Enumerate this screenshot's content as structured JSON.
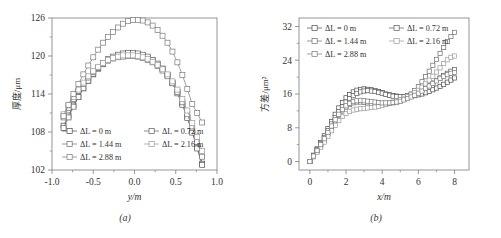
{
  "figure": {
    "background_color": "#ffffff",
    "axis_color": "#8a8a8a",
    "text_color": "#333333",
    "panels": [
      {
        "caption": "(a)",
        "name": "panel-a"
      },
      {
        "caption": "(b)",
        "name": "panel-b"
      }
    ]
  },
  "chart_data": [
    {
      "type": "line",
      "panel": "(a)",
      "title": "",
      "xlabel": "y/m",
      "ylabel": "厚度/μm",
      "xlim": [
        -1.0,
        1.0
      ],
      "ylim": [
        102,
        126
      ],
      "xticks": [
        -1.0,
        -0.5,
        0.0,
        0.5,
        1.0
      ],
      "xticklabels": [
        "-1.0",
        "-0.5",
        "0.0",
        "0.5",
        "1.0"
      ],
      "yticks": [
        102,
        108,
        114,
        120,
        126
      ],
      "yticklabels": [
        "102",
        "108",
        "114",
        "120",
        "126"
      ],
      "grid": false,
      "legend_position": "lower-center",
      "marker": "open-square",
      "series": [
        {
          "name": "ΔL = 0 m",
          "color": "#4a4a4a",
          "x": [
            -0.86,
            -0.8,
            -0.74,
            -0.68,
            -0.62,
            -0.56,
            -0.5,
            -0.44,
            -0.38,
            -0.32,
            -0.26,
            -0.2,
            -0.14,
            -0.08,
            -0.02,
            0.04,
            0.1,
            0.16,
            0.22,
            0.28,
            0.34,
            0.4,
            0.46,
            0.52,
            0.58,
            0.64,
            0.7,
            0.76,
            0.82
          ],
          "y": [
            109.0,
            110.6,
            112.2,
            113.6,
            114.9,
            116.1,
            117.1,
            118.0,
            118.7,
            119.3,
            119.7,
            120.0,
            120.2,
            120.3,
            120.3,
            120.2,
            120.0,
            119.7,
            119.3,
            118.7,
            118.0,
            117.0,
            115.8,
            114.3,
            112.5,
            110.4,
            108.1,
            105.6,
            103.0
          ]
        },
        {
          "name": "ΔL = 0.72 m",
          "color": "#5c5c5c",
          "x": [
            -0.86,
            -0.8,
            -0.74,
            -0.68,
            -0.62,
            -0.56,
            -0.5,
            -0.44,
            -0.38,
            -0.32,
            -0.26,
            -0.2,
            -0.14,
            -0.08,
            -0.02,
            0.04,
            0.1,
            0.16,
            0.22,
            0.28,
            0.34,
            0.4,
            0.46,
            0.52,
            0.58,
            0.64,
            0.7,
            0.76,
            0.82
          ],
          "y": [
            108.6,
            110.3,
            112.0,
            113.5,
            114.9,
            116.1,
            117.2,
            118.1,
            118.9,
            119.5,
            119.9,
            120.2,
            120.4,
            120.5,
            120.5,
            120.4,
            120.2,
            119.9,
            119.4,
            118.8,
            118.0,
            117.0,
            115.7,
            114.1,
            112.3,
            110.2,
            107.9,
            105.4,
            102.8
          ]
        },
        {
          "name": "ΔL = 1.44 m",
          "color": "#6e6e6e",
          "x": [
            -0.86,
            -0.8,
            -0.74,
            -0.68,
            -0.62,
            -0.56,
            -0.5,
            -0.44,
            -0.38,
            -0.32,
            -0.26,
            -0.2,
            -0.14,
            -0.08,
            -0.02,
            0.04,
            0.1,
            0.16,
            0.22,
            0.28,
            0.34,
            0.4,
            0.46,
            0.52,
            0.58,
            0.64,
            0.7,
            0.76,
            0.82
          ],
          "y": [
            110.3,
            111.8,
            113.2,
            114.5,
            115.6,
            116.6,
            117.5,
            118.2,
            118.8,
            119.3,
            119.6,
            119.8,
            119.9,
            120.0,
            120.0,
            119.9,
            119.7,
            119.4,
            119.0,
            118.4,
            117.7,
            116.8,
            115.7,
            114.3,
            112.7,
            110.8,
            108.7,
            106.4,
            104.1
          ]
        },
        {
          "name": "ΔL = 2.16 m",
          "color": "#9a9a9a",
          "x": [
            -0.86,
            -0.8,
            -0.74,
            -0.68,
            -0.62,
            -0.56,
            -0.5,
            -0.44,
            -0.38,
            -0.32,
            -0.26,
            -0.2,
            -0.14,
            -0.08,
            -0.02,
            0.04,
            0.1,
            0.16,
            0.22,
            0.28,
            0.34,
            0.4,
            0.46,
            0.52,
            0.58,
            0.64,
            0.7,
            0.76,
            0.82
          ],
          "y": [
            110.8,
            112.2,
            113.5,
            114.7,
            115.8,
            116.8,
            117.6,
            118.3,
            118.9,
            119.4,
            119.7,
            119.9,
            120.1,
            120.1,
            120.1,
            120.0,
            119.8,
            119.5,
            119.1,
            118.6,
            117.9,
            117.1,
            116.0,
            114.7,
            113.2,
            111.4,
            109.4,
            107.2,
            105.0
          ]
        },
        {
          "name": "ΔL = 2.88 m",
          "color": "#7a7a7a",
          "x": [
            -0.86,
            -0.8,
            -0.74,
            -0.68,
            -0.62,
            -0.56,
            -0.5,
            -0.44,
            -0.38,
            -0.32,
            -0.26,
            -0.2,
            -0.14,
            -0.08,
            -0.02,
            0.04,
            0.1,
            0.16,
            0.22,
            0.28,
            0.34,
            0.4,
            0.46,
            0.52,
            0.58,
            0.64,
            0.7,
            0.76,
            0.82
          ],
          "y": [
            110.5,
            112.3,
            114.0,
            115.6,
            117.1,
            118.5,
            119.8,
            121.0,
            122.1,
            123.0,
            123.8,
            124.5,
            125.1,
            125.5,
            125.7,
            125.7,
            125.6,
            125.3,
            124.8,
            124.1,
            123.2,
            122.1,
            120.7,
            119.0,
            117.0,
            114.8,
            112.4,
            111.0,
            109.5
          ]
        }
      ]
    },
    {
      "type": "line",
      "panel": "(b)",
      "title": "",
      "xlabel": "x/m",
      "ylabel": "方差/μm²",
      "xlim": [
        -0.6,
        8.8
      ],
      "ylim": [
        -2,
        34
      ],
      "xticks": [
        0,
        2,
        4,
        6,
        8
      ],
      "xticklabels": [
        "0",
        "2",
        "4",
        "6",
        "8"
      ],
      "yticks": [
        0,
        8,
        16,
        24,
        32
      ],
      "yticklabels": [
        "0",
        "8",
        "16",
        "24",
        "32"
      ],
      "grid": false,
      "legend_position": "upper-left",
      "marker": "open-square",
      "series": [
        {
          "name": "ΔL = 0 m",
          "color": "#4a4a4a",
          "x": [
            0.0,
            0.2,
            0.4,
            0.6,
            0.8,
            1.0,
            1.2,
            1.4,
            1.6,
            1.8,
            2.0,
            2.2,
            2.4,
            2.6,
            2.8,
            3.0,
            3.2,
            3.4,
            3.6,
            3.8,
            4.0,
            4.2,
            4.4,
            4.6,
            4.8,
            5.0,
            5.2,
            5.4,
            5.6,
            5.8,
            6.0,
            6.2,
            6.4,
            6.6,
            6.8,
            7.0,
            7.2,
            7.4,
            7.6,
            7.8,
            8.0
          ],
          "y": [
            0.0,
            1.5,
            3.0,
            4.5,
            6.1,
            7.8,
            9.5,
            11.2,
            12.7,
            14.0,
            15.1,
            15.9,
            16.5,
            16.9,
            17.1,
            17.2,
            17.1,
            17.0,
            16.8,
            16.6,
            16.3,
            16.0,
            15.8,
            15.6,
            15.5,
            15.4,
            15.4,
            15.4,
            15.5,
            15.6,
            15.8,
            16.0,
            16.3,
            16.6,
            17.0,
            17.4,
            17.8,
            18.3,
            18.8,
            19.3,
            19.8
          ]
        },
        {
          "name": "ΔL = 0.72 m",
          "color": "#5c5c5c",
          "x": [
            0.0,
            0.2,
            0.4,
            0.6,
            0.8,
            1.0,
            1.2,
            1.4,
            1.6,
            1.8,
            2.0,
            2.2,
            2.4,
            2.6,
            2.8,
            3.0,
            3.2,
            3.4,
            3.6,
            3.8,
            4.0,
            4.2,
            4.4,
            4.6,
            4.8,
            5.0,
            5.2,
            5.4,
            5.6,
            5.8,
            6.0,
            6.2,
            6.4,
            6.6,
            6.8,
            7.0,
            7.2,
            7.4,
            7.6,
            7.8,
            8.0
          ],
          "y": [
            0.0,
            1.4,
            2.8,
            4.2,
            5.7,
            7.3,
            8.9,
            10.4,
            11.8,
            13.0,
            14.1,
            14.9,
            15.6,
            16.1,
            16.5,
            16.7,
            16.8,
            16.7,
            16.6,
            16.4,
            16.2,
            15.9,
            15.7,
            15.5,
            15.4,
            15.4,
            15.4,
            15.6,
            15.8,
            16.1,
            16.5,
            17.0,
            17.5,
            18.0,
            18.6,
            19.2,
            19.8,
            20.4,
            20.9,
            21.4,
            21.8
          ]
        },
        {
          "name": "ΔL = 1.44 m",
          "color": "#6e6e6e",
          "x": [
            0.0,
            0.2,
            0.4,
            0.6,
            0.8,
            1.0,
            1.2,
            1.4,
            1.6,
            1.8,
            2.0,
            2.2,
            2.4,
            2.6,
            2.8,
            3.0,
            3.2,
            3.4,
            3.6,
            3.8,
            4.0,
            4.2,
            4.4,
            4.6,
            4.8,
            5.0,
            5.2,
            5.4,
            5.6,
            5.8,
            6.0,
            6.2,
            6.4,
            6.6,
            6.8,
            7.0,
            7.2,
            7.4,
            7.6,
            7.8,
            8.0
          ],
          "y": [
            0.0,
            1.2,
            2.4,
            3.7,
            5.1,
            6.6,
            8.1,
            9.6,
            10.9,
            12.0,
            12.9,
            13.5,
            13.9,
            14.1,
            14.1,
            14.0,
            13.9,
            13.8,
            13.7,
            13.7,
            13.7,
            13.7,
            13.8,
            13.9,
            14.1,
            14.4,
            14.8,
            15.3,
            16.0,
            16.8,
            17.8,
            18.9,
            20.1,
            21.4,
            22.8,
            24.2,
            25.6,
            27.0,
            28.4,
            29.6,
            30.6
          ]
        },
        {
          "name": "ΔL = 2.16 m",
          "color": "#9a9a9a",
          "x": [
            0.0,
            0.2,
            0.4,
            0.6,
            0.8,
            1.0,
            1.2,
            1.4,
            1.6,
            1.8,
            2.0,
            2.2,
            2.4,
            2.6,
            2.8,
            3.0,
            3.2,
            3.4,
            3.6,
            3.8,
            4.0,
            4.2,
            4.4,
            4.6,
            4.8,
            5.0,
            5.2,
            5.4,
            5.6,
            5.8,
            6.0,
            6.2,
            6.4,
            6.6,
            6.8,
            7.0,
            7.2,
            7.4,
            7.6,
            7.8,
            8.0
          ],
          "y": [
            0.0,
            1.1,
            2.2,
            3.4,
            4.6,
            6.0,
            7.3,
            8.6,
            9.7,
            10.7,
            11.4,
            11.9,
            12.2,
            12.4,
            12.5,
            12.6,
            12.7,
            12.8,
            12.9,
            13.1,
            13.3,
            13.5,
            13.8,
            14.1,
            14.4,
            14.7,
            15.0,
            15.4,
            15.8,
            16.3,
            16.9,
            17.6,
            18.4,
            19.3,
            20.2,
            21.2,
            22.2,
            23.2,
            24.1,
            24.7,
            25.0
          ]
        },
        {
          "name": "ΔL = 2.88 m",
          "color": "#7a7a7a",
          "x": [
            0.0,
            0.2,
            0.4,
            0.6,
            0.8,
            1.0,
            1.2,
            1.4,
            1.6,
            1.8,
            2.0,
            2.2,
            2.4,
            2.6,
            2.8,
            3.0,
            3.2,
            3.4,
            3.6,
            3.8,
            4.0,
            4.2,
            4.4,
            4.6,
            4.8,
            5.0,
            5.2,
            5.4,
            5.6,
            5.8,
            6.0,
            6.2,
            6.4,
            6.6,
            6.8,
            7.0,
            7.2,
            7.4,
            7.6,
            7.8,
            8.0
          ],
          "y": [
            0.0,
            1.3,
            2.6,
            4.0,
            5.4,
            6.9,
            8.4,
            9.9,
            11.2,
            12.3,
            13.2,
            13.8,
            14.2,
            14.4,
            14.5,
            14.4,
            14.3,
            14.2,
            14.1,
            14.0,
            13.9,
            13.9,
            13.9,
            14.0,
            14.1,
            14.3,
            14.6,
            14.9,
            15.3,
            15.7,
            16.2,
            16.7,
            17.3,
            17.9,
            18.5,
            19.1,
            19.7,
            20.2,
            20.6,
            20.9,
            21.1
          ]
        }
      ]
    }
  ],
  "legend": {
    "entries": [
      "ΔL = 0 m",
      "ΔL = 0.72 m",
      "ΔL = 1.44 m",
      "ΔL = 2.16 m",
      "ΔL = 2.88 m"
    ]
  }
}
